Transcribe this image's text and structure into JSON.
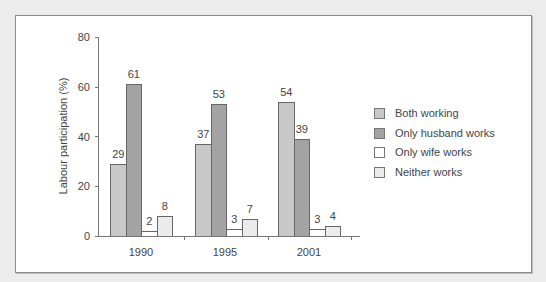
{
  "chart_data": {
    "type": "bar",
    "title": "",
    "xlabel": "",
    "ylabel": "Labour participation (%)",
    "ylim": [
      0,
      80
    ],
    "yticks": [
      0,
      20,
      40,
      60,
      80
    ],
    "grid": false,
    "legend_position": "right",
    "categories": [
      "1990",
      "1995",
      "2001"
    ],
    "series": [
      {
        "name": "Both working",
        "values": [
          29,
          37,
          54
        ],
        "color": "#c8c8c8"
      },
      {
        "name": "Only husband works",
        "values": [
          61,
          53,
          39
        ],
        "color": "#a3a3a3"
      },
      {
        "name": "Only wife works",
        "values": [
          2,
          3,
          3
        ],
        "color": "#ffffff"
      },
      {
        "name": "Neither works",
        "values": [
          8,
          7,
          4
        ],
        "color": "#ebebeb"
      }
    ],
    "data_labels": true
  },
  "labels": {
    "ylabel": "Labour participation (%)",
    "yticks": [
      "0",
      "20",
      "40",
      "60",
      "80"
    ],
    "categories": [
      "1990",
      "1995",
      "2001"
    ],
    "legend": [
      "Both working",
      "Only husband works",
      "Only wife works",
      "Neither works"
    ]
  }
}
